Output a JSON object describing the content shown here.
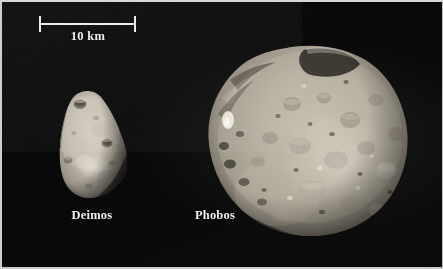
{
  "figure": {
    "type": "astronomical-photograph-comparison",
    "background_color": "#0a0a0a",
    "border_color": "#d2d2d2",
    "width": 443,
    "height": 269
  },
  "scale_bar": {
    "label": "10 km",
    "value": 10,
    "unit": "km",
    "bar_color": "#ecece6",
    "pixel_length": 98,
    "endpoints_x": [
      38,
      136
    ],
    "y": 22
  },
  "bodies": [
    {
      "name": "Deimos",
      "label": "Deimos",
      "label_x": 89,
      "label_y": 213,
      "shape": "rounded-triangular",
      "fill_color": "#b9b2a6",
      "bounds": {
        "x": 57,
        "y": 90,
        "width": 68,
        "height": 108
      },
      "approx_width_km": 7,
      "craters": 5
    },
    {
      "name": "Phobos",
      "label": "Phobos",
      "label_x": 213,
      "label_y": 213,
      "shape": "irregular-ellipsoid",
      "fill_color": "#a9a296",
      "bounds": {
        "x": 203,
        "y": 45,
        "width": 200,
        "height": 190
      },
      "approx_width_km": 22,
      "craters": 22
    }
  ],
  "colors": {
    "background": "#0a0a0a",
    "text": "#f2f1ea",
    "scalebar": "#ecece6",
    "deimos_surface": "#b9b2a6",
    "phobos_surface": "#a9a296",
    "shadow": "#1a1813"
  }
}
